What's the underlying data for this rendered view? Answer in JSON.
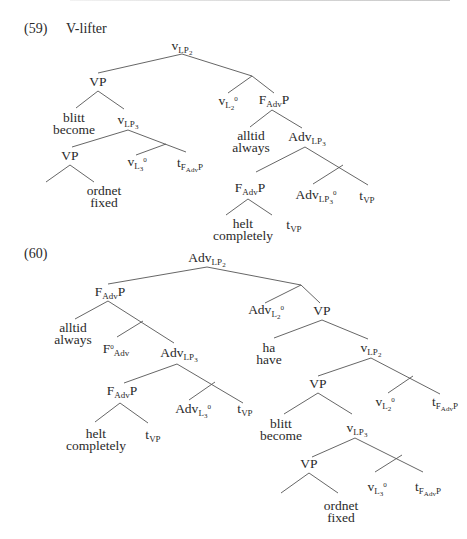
{
  "examples": [
    {
      "number": "(59)",
      "title": "V-lifter",
      "nodes": {
        "root": {
          "base": "v",
          "sub": "LP",
          "subsub": "2"
        },
        "vp1": "VP",
        "blitt": "blitt",
        "become": "become",
        "vlp3": {
          "base": "v",
          "sub": "LP",
          "subsub": "3"
        },
        "vp2": "VP",
        "ordnet": "ordnet",
        "fixed": "fixed",
        "vl3": {
          "base": "v",
          "sub": "L",
          "subsub": "3",
          "sup": "0"
        },
        "tfadvp1": {
          "base": "t",
          "sub": "F",
          "subsub": "Adv",
          "tail": "P"
        },
        "vl2": {
          "base": "v",
          "sub": "L",
          "subsub": "2",
          "sup": "0"
        },
        "fadvp1": {
          "base": "F",
          "sub": "Adv",
          "tail": "P"
        },
        "alltid": "alltid",
        "always": "always",
        "advlp3": {
          "base": "Adv",
          "sub": "LP",
          "subsub": "3"
        },
        "fadvp2": {
          "base": "F",
          "sub": "Adv",
          "tail": "P"
        },
        "helt": "helt",
        "completely": "completely",
        "tvp1": {
          "base": "t",
          "sub": "VP"
        },
        "advlp3_0": {
          "base": "Adv",
          "sub": "LP",
          "subsub": "3",
          "sup": "0"
        },
        "tvp2": {
          "base": "t",
          "sub": "VP"
        }
      }
    },
    {
      "number": "(60)",
      "title": "",
      "nodes": {
        "root": {
          "base": "Adv",
          "sub": "LP",
          "subsub": "2"
        },
        "fadvp1": {
          "base": "F",
          "sub": "Adv",
          "tail": "P"
        },
        "alltid": "alltid",
        "always": "always",
        "fadv0": {
          "base": "F",
          "sub": "Adv",
          "sup": "0"
        },
        "advlp3": {
          "base": "Adv",
          "sub": "LP",
          "subsub": "3"
        },
        "fadvp2": {
          "base": "F",
          "sub": "Adv",
          "tail": "P"
        },
        "helt": "helt",
        "completely": "completely",
        "tvp1": {
          "base": "t",
          "sub": "VP"
        },
        "advl3": {
          "base": "Adv",
          "sub": "L",
          "subsub": "3",
          "sup": "0"
        },
        "tvp2": {
          "base": "t",
          "sub": "VP"
        },
        "advl2": {
          "base": "Adv",
          "sub": "L",
          "subsub": "2",
          "sup": "0"
        },
        "vp1": "VP",
        "ha": "ha",
        "have": "have",
        "vlp2": {
          "base": "v",
          "sub": "LP",
          "subsub": "2"
        },
        "vp2": "VP",
        "blitt": "blitt",
        "become": "become",
        "vlp3": {
          "base": "v",
          "sub": "LP",
          "subsub": "3"
        },
        "vl2": {
          "base": "v",
          "sub": "L",
          "subsub": "2",
          "sup": "0"
        },
        "tfadvp1": {
          "base": "t",
          "sub": "F",
          "subsub": "Adv",
          "tail": "P"
        },
        "vp3": "VP",
        "ordnet": "ordnet",
        "fixed": "fixed",
        "vl3": {
          "base": "v",
          "sub": "L",
          "subsub": "3",
          "sup": "0"
        },
        "tfadvp2": {
          "base": "t",
          "sub": "F",
          "subsub": "Adv",
          "tail": "P"
        }
      }
    }
  ]
}
